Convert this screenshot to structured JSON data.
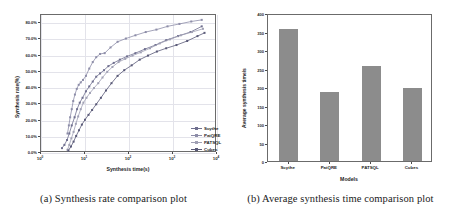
{
  "figure": {
    "panels": [
      {
        "id": "synthesis-rate-plot",
        "caption": "(a) Synthesis rate comparison plot"
      },
      {
        "id": "average-synthesis-time-plot",
        "caption": "(b) Average synthesis time comparison plot"
      }
    ]
  },
  "colors": {
    "scythe": "#6f6f8f",
    "patqre": "#8d8da8",
    "patsql": "#a0a0b4",
    "cubes": "#5a5a78",
    "bar_fill": "#8c8c8c",
    "axis": "#6b6b6b",
    "grid": "#e3e3ea",
    "text": "#1c1c1c"
  },
  "chart_data": [
    {
      "type": "line",
      "id": "synthesis-rate-comparison",
      "title": "",
      "xlabel": "Synthesis time(s)",
      "ylabel": "Synthesis rate(%)",
      "xscale": "log",
      "xlim": [
        1,
        10000
      ],
      "ylim": [
        0,
        85
      ],
      "grid": true,
      "legend_position": "lower-right",
      "xtick_labels": [
        "10^0",
        "10^1",
        "10^2",
        "10^3",
        "10^4"
      ],
      "xtick_values": [
        1,
        10,
        100,
        1000,
        10000
      ],
      "ytick_labels": [
        "0.0%",
        "10.0%",
        "20.0%",
        "30.0%",
        "40.0%",
        "50.0%",
        "60.0%",
        "70.0%",
        "80.0%"
      ],
      "ytick_values": [
        0,
        10,
        20,
        30,
        40,
        50,
        60,
        70,
        80
      ],
      "series": [
        {
          "name": "Scythe",
          "color": "#6f6f8f",
          "x": [
            3.0,
            3.4,
            3.9,
            4.4,
            5.0,
            5.8,
            6.6,
            7.6,
            8.8,
            10.5,
            12.5,
            15.0,
            18.0,
            22.0,
            27.0,
            34.0,
            45.0,
            62.0,
            90.0,
            140.0,
            230.0,
            400.0,
            700.0,
            1300.0,
            2500.0,
            4500.0
          ],
          "y": [
            3.0,
            5.0,
            8.0,
            12.0,
            17.0,
            22.0,
            27.0,
            31.0,
            34.0,
            38.0,
            41.0,
            44.0,
            47.0,
            49.0,
            51.0,
            53.5,
            55.5,
            57.5,
            59.5,
            61.5,
            64.0,
            66.5,
            69.5,
            72.0,
            74.5,
            78.0
          ]
        },
        {
          "name": "PatQRE",
          "color": "#8d8da8",
          "x": [
            4.0,
            4.3,
            4.6,
            5.0,
            5.4,
            5.9,
            6.5,
            7.2,
            8.0,
            9.0,
            10.5,
            12.5,
            15.0,
            18.0,
            22.0,
            28.0,
            38.0,
            55.0,
            85.0,
            140.0,
            240.0,
            420.0,
            750.0,
            1400.0,
            2600.0,
            4500.0
          ],
          "y": [
            12.0,
            17.0,
            22.0,
            27.0,
            32.0,
            36.0,
            39.5,
            42.0,
            43.5,
            45.0,
            47.5,
            52.0,
            56.0,
            59.0,
            61.0,
            61.5,
            65.0,
            68.5,
            70.5,
            72.5,
            74.5,
            76.0,
            78.0,
            79.5,
            81.0,
            82.0
          ]
        },
        {
          "name": "PATSQL",
          "color": "#a0a0b4",
          "x": [
            4.0,
            4.4,
            4.9,
            5.5,
            6.2,
            7.0,
            8.0,
            9.2,
            10.8,
            13.0,
            16.0,
            20.0,
            25.0,
            32.0,
            42.0,
            58.0,
            82.0,
            120.0,
            185.0,
            300.0,
            500.0,
            850.0,
            1500.0,
            2700.0,
            4800.0
          ],
          "y": [
            2.0,
            5.0,
            9.0,
            13.0,
            18.0,
            22.5,
            27.0,
            31.0,
            34.0,
            37.0,
            40.0,
            43.0,
            46.5,
            50.0,
            53.0,
            56.0,
            58.0,
            60.0,
            62.0,
            64.5,
            67.5,
            70.0,
            72.5,
            74.5,
            76.5
          ]
        },
        {
          "name": "Cubes",
          "color": "#5a5a78",
          "x": [
            4.2,
            4.8,
            5.5,
            6.3,
            7.3,
            8.5,
            10.0,
            12.0,
            14.5,
            18.0,
            23.0,
            30.0,
            40.0,
            55.0,
            78.0,
            115.0,
            175.0,
            270.0,
            430.0,
            700.0,
            1200.0,
            2100.0,
            3600.0,
            5200.0
          ],
          "y": [
            1.5,
            4.0,
            7.0,
            10.5,
            14.0,
            17.5,
            20.5,
            23.5,
            26.5,
            30.0,
            34.0,
            38.5,
            43.0,
            47.5,
            51.0,
            54.0,
            57.5,
            60.0,
            62.5,
            64.5,
            66.5,
            69.0,
            72.0,
            74.0
          ]
        }
      ]
    },
    {
      "type": "bar",
      "id": "average-synthesis-time-comparison",
      "title": "",
      "xlabel": "Models",
      "ylabel": "Average synthesis time/s",
      "categories": [
        "Scythe",
        "PatQRE",
        "PATSQL",
        "Cubes"
      ],
      "values": [
        358,
        187,
        256,
        198
      ],
      "ylim": [
        0,
        400
      ],
      "ytick_labels": [
        "0",
        "50",
        "100",
        "150",
        "200",
        "250",
        "300",
        "350",
        "400"
      ],
      "ytick_values": [
        0,
        50,
        100,
        150,
        200,
        250,
        300,
        350,
        400
      ],
      "grid": false,
      "bar_color": "#8c8c8c"
    }
  ]
}
